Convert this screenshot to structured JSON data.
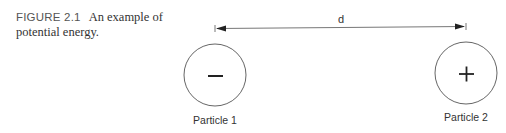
{
  "caption": {
    "figure_label": "FIGURE 2.1",
    "text": "An example of potential energy."
  },
  "diagram": {
    "distance_label": "d",
    "particles": [
      {
        "label": "Particle 1",
        "sign": "−"
      },
      {
        "label": "Particle 2",
        "sign": "+"
      }
    ],
    "colors": {
      "line": "#555555",
      "text": "#333333"
    }
  }
}
